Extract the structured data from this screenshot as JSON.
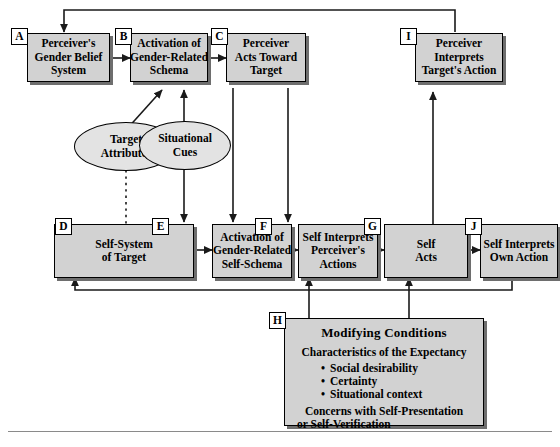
{
  "diagram": {
    "colors": {
      "box_fill": "#d2d2d2",
      "oval_fill": "#e3e3e3",
      "border": "#000000",
      "shadow": "#6e6e6e",
      "rule": "#8a8a8a",
      "background": "#ffffff"
    },
    "nodes": [
      {
        "tag": "A",
        "lines": [
          "Perceiver's",
          "Gender Belief",
          "System"
        ]
      },
      {
        "tag": "B",
        "lines": [
          "Activation of",
          "Gender-Related",
          "Schema"
        ]
      },
      {
        "tag": "C",
        "lines": [
          "Perceiver",
          "Acts Toward",
          "Target"
        ]
      },
      {
        "tag": "I",
        "lines": [
          "Perceiver",
          "Interprets",
          "Target's Action"
        ]
      },
      {
        "tag": "D",
        "lines": [
          "Self-System",
          "of Target"
        ]
      },
      {
        "tag": "E",
        "lines": [
          "Activation of",
          "Gender-Related",
          "Self-Schema"
        ]
      },
      {
        "tag": "F",
        "lines": [
          "Self Interprets",
          "Perceiver's",
          "Actions"
        ]
      },
      {
        "tag": "G",
        "lines": [
          "Self",
          "Acts"
        ]
      },
      {
        "tag": "J",
        "lines": [
          "Self Interprets",
          "Own Action"
        ]
      }
    ],
    "ovals": [
      {
        "name": "target-attributes",
        "lines": [
          "Target",
          "Attributes"
        ]
      },
      {
        "name": "situational-cues",
        "lines": [
          "Situational",
          "Cues"
        ]
      }
    ],
    "modifying_conditions": {
      "tag": "H",
      "title": "Modifying Conditions",
      "subtitle": "Characteristics of the Expectancy",
      "bullets": [
        "Social desirability",
        "Certainty",
        "Situational context"
      ],
      "footer_lines": [
        "Concerns with Self-Presentation",
        "or Self-Verification"
      ]
    }
  }
}
